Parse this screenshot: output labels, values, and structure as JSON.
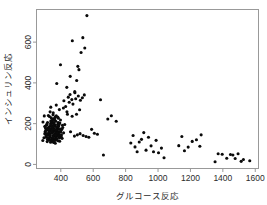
{
  "chart_data": {
    "type": "scatter",
    "title": "",
    "xlabel": "グルコース反応",
    "ylabel": "インシュリン反応",
    "xlim": [
      250,
      1620
    ],
    "ylim": [
      -20,
      760
    ],
    "xticks": [
      400,
      600,
      800,
      1000,
      1200,
      1400,
      1600
    ],
    "xticklabels": [
      "400",
      "600",
      "800",
      "1000",
      "1200",
      "1400",
      "1600"
    ],
    "yticks": [
      0,
      200,
      400,
      600
    ],
    "yticklabels": [
      "0",
      "200",
      "400",
      "600"
    ],
    "grid": false,
    "legend": null,
    "marker": "filled-circle",
    "marker_color": "#0a0a0a",
    "frame_color": "#999999",
    "background_color": "#ffffff",
    "n_points": 182,
    "points": [
      [
        356,
        124
      ],
      [
        289,
        117
      ],
      [
        319,
        143
      ],
      [
        356,
        199
      ],
      [
        323,
        240
      ],
      [
        381,
        157
      ],
      [
        350,
        221
      ],
      [
        301,
        186
      ],
      [
        379,
        142
      ],
      [
        296,
        131
      ],
      [
        353,
        221
      ],
      [
        306,
        178
      ],
      [
        332,
        136
      ],
      [
        337,
        200
      ],
      [
        348,
        208
      ],
      [
        332,
        152
      ],
      [
        330,
        235
      ],
      [
        315,
        194
      ],
      [
        364,
        148
      ],
      [
        384,
        173
      ],
      [
        356,
        108
      ],
      [
        290,
        208
      ],
      [
        298,
        238
      ],
      [
        372,
        126
      ],
      [
        376,
        175
      ],
      [
        402,
        137
      ],
      [
        318,
        123
      ],
      [
        339,
        168
      ],
      [
        380,
        196
      ],
      [
        365,
        232
      ],
      [
        334,
        258
      ],
      [
        406,
        172
      ],
      [
        301,
        150
      ],
      [
        346,
        113
      ],
      [
        354,
        142
      ],
      [
        372,
        238
      ],
      [
        393,
        114
      ],
      [
        318,
        206
      ],
      [
        358,
        166
      ],
      [
        328,
        183
      ],
      [
        342,
        122
      ],
      [
        384,
        205
      ],
      [
        311,
        171
      ],
      [
        363,
        190
      ],
      [
        345,
        153
      ],
      [
        398,
        218
      ],
      [
        324,
        167
      ],
      [
        368,
        135
      ],
      [
        352,
        244
      ],
      [
        379,
        161
      ],
      [
        329,
        128
      ],
      [
        410,
        192
      ],
      [
        339,
        214
      ],
      [
        357,
        177
      ],
      [
        303,
        160
      ],
      [
        389,
        148
      ],
      [
        343,
        186
      ],
      [
        371,
        120
      ],
      [
        360,
        225
      ],
      [
        320,
        145
      ],
      [
        395,
        160
      ],
      [
        348,
        131
      ],
      [
        335,
        175
      ],
      [
        382,
        182
      ],
      [
        366,
        104
      ],
      [
        313,
        197
      ],
      [
        374,
        152
      ],
      [
        353,
        169
      ],
      [
        392,
        130
      ],
      [
        331,
        119
      ],
      [
        417,
        155
      ],
      [
        344,
        203
      ],
      [
        361,
        140
      ],
      [
        377,
        167
      ],
      [
        308,
        134
      ],
      [
        387,
        188
      ],
      [
        350,
        158
      ],
      [
        369,
        212
      ],
      [
        325,
        149
      ],
      [
        341,
        229
      ],
      [
        404,
        145
      ],
      [
        358,
        117
      ],
      [
        333,
        163
      ],
      [
        385,
        227
      ],
      [
        349,
        180
      ],
      [
        316,
        112
      ],
      [
        375,
        144
      ],
      [
        362,
        196
      ],
      [
        397,
        174
      ],
      [
        327,
        156
      ],
      [
        355,
        191
      ],
      [
        370,
        125
      ],
      [
        340,
        210
      ],
      [
        388,
        139
      ],
      [
        306,
        164
      ],
      [
        412,
        181
      ],
      [
        351,
        134
      ],
      [
        367,
        159
      ],
      [
        383,
        116
      ],
      [
        336,
        190
      ],
      [
        359,
        147
      ],
      [
        394,
        203
      ],
      [
        322,
        129
      ],
      [
        347,
        173
      ],
      [
        378,
        154
      ],
      [
        363,
        218
      ],
      [
        310,
        141
      ],
      [
        400,
        166
      ],
      [
        337,
        109
      ],
      [
        373,
        184
      ],
      [
        352,
        132
      ],
      [
        390,
        198
      ],
      [
        321,
        179
      ],
      [
        366,
        121
      ],
      [
        343,
        162
      ],
      [
        381,
        233
      ],
      [
        314,
        152
      ],
      [
        408,
        128
      ],
      [
        346,
        185
      ],
      [
        370,
        170
      ],
      [
        335,
        143
      ],
      [
        357,
        206
      ],
      [
        386,
        137
      ],
      [
        328,
        172
      ],
      [
        360,
        115
      ],
      [
        399,
        159
      ],
      [
        341,
        195
      ],
      [
        376,
        127
      ],
      [
        305,
        188
      ],
      [
        368,
        146
      ],
      [
        353,
        253
      ],
      [
        391,
        269
      ],
      [
        338,
        281
      ],
      [
        372,
        291
      ],
      [
        416,
        277
      ],
      [
        430,
        284
      ],
      [
        419,
        312
      ],
      [
        452,
        305
      ],
      [
        446,
        330
      ],
      [
        468,
        318
      ],
      [
        438,
        258
      ],
      [
        457,
        343
      ],
      [
        475,
        296
      ],
      [
        492,
        322
      ],
      [
        508,
        336
      ],
      [
        521,
        315
      ],
      [
        487,
        352
      ],
      [
        533,
        327
      ],
      [
        545,
        341
      ],
      [
        516,
        268
      ],
      [
        497,
        246
      ],
      [
        470,
        236
      ],
      [
        441,
        246
      ],
      [
        424,
        196
      ],
      [
        460,
        160
      ],
      [
        484,
        139
      ],
      [
        502,
        145
      ],
      [
        519,
        151
      ],
      [
        538,
        142
      ],
      [
        556,
        137
      ],
      [
        573,
        133
      ],
      [
        590,
        172
      ],
      [
        607,
        153
      ],
      [
        626,
        148
      ],
      [
        645,
        317
      ],
      [
        663,
        46
      ],
      [
        690,
        223
      ],
      [
        712,
        239
      ],
      [
        742,
        212
      ],
      [
        398,
        489
      ],
      [
        375,
        397
      ],
      [
        437,
        378
      ],
      [
        458,
        432
      ],
      [
        471,
        607
      ],
      [
        498,
        412
      ],
      [
        512,
        465
      ],
      [
        525,
        549
      ],
      [
        536,
        622
      ],
      [
        548,
        571
      ],
      [
        561,
        730
      ],
      [
        505,
        481
      ],
      [
        486,
        357
      ],
      [
        832,
        105
      ],
      [
        846,
        142
      ],
      [
        858,
        86
      ],
      [
        871,
        62
      ],
      [
        884,
        110
      ],
      [
        898,
        123
      ],
      [
        912,
        156
      ],
      [
        926,
        70
      ],
      [
        941,
        133
      ],
      [
        957,
        91
      ],
      [
        972,
        62
      ],
      [
        988,
        118
      ],
      [
        1003,
        57
      ],
      [
        1021,
        80
      ],
      [
        1037,
        33
      ],
      [
        1128,
        92
      ],
      [
        1147,
        137
      ],
      [
        1163,
        67
      ],
      [
        1186,
        85
      ],
      [
        1211,
        113
      ],
      [
        1237,
        121
      ],
      [
        1258,
        89
      ],
      [
        1266,
        145
      ],
      [
        1352,
        13
      ],
      [
        1371,
        52
      ],
      [
        1396,
        50
      ],
      [
        1424,
        30
      ],
      [
        1447,
        49
      ],
      [
        1462,
        46
      ],
      [
        1476,
        29
      ],
      [
        1494,
        52
      ],
      [
        1513,
        15
      ],
      [
        1527,
        24
      ],
      [
        1566,
        18
      ]
    ]
  }
}
